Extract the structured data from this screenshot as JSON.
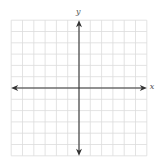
{
  "chart_data": {
    "type": "coordinate-plane",
    "title": "",
    "xlabel": "x",
    "ylabel": "y",
    "grid": true,
    "x_cells_each_side": 6,
    "y_cells_each_side": 6,
    "xlim": [
      -6,
      6
    ],
    "ylim": [
      -6,
      6
    ],
    "tick_labels": [],
    "data_points": []
  },
  "labels": {
    "x_axis": "x",
    "y_axis": "y"
  },
  "colors": {
    "grid": "#dcdcdc",
    "axis": "#333333",
    "label": "#555555",
    "background": "#ffffff"
  },
  "layout": {
    "origin_x": 79,
    "origin_y": 88,
    "cell": 11.3,
    "grid_left": 11,
    "grid_right": 147,
    "grid_top": 18,
    "grid_bottom": 158
  }
}
